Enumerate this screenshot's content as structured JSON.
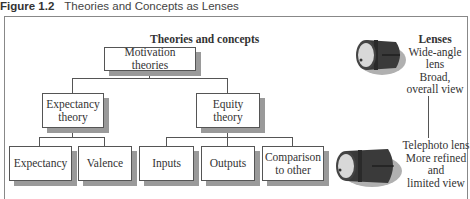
{
  "caption": {
    "figure_label": "Figure 1.2",
    "title": "Theories and Concepts as Lenses"
  },
  "diagram": {
    "heading": "Theories and concepts",
    "root": "Motivation theories",
    "branches": [
      {
        "label_line1": "Expectancy",
        "label_line2": "theory",
        "children": [
          "Expectancy",
          "Valence"
        ]
      },
      {
        "label_line1": "Equity",
        "label_line2": "theory",
        "children": [
          "Inputs",
          "Outputs"
        ],
        "extra_child_line1": "Comparison",
        "extra_child_line2": "to other"
      }
    ]
  },
  "lenses": {
    "heading": "Lenses",
    "wide": {
      "line1": "Wide-angle",
      "line2": "lens",
      "line3": "Broad,",
      "line4": "overall view"
    },
    "tele": {
      "line1": "Telephoto lens",
      "line2": "More refined",
      "line3": "and",
      "line4": "limited view"
    }
  },
  "colors": {
    "box_border": "#555555",
    "shadow": "#9a9a9a",
    "lens_body": "#3a3a3a",
    "lens_shadow": "#b0b0b0"
  }
}
